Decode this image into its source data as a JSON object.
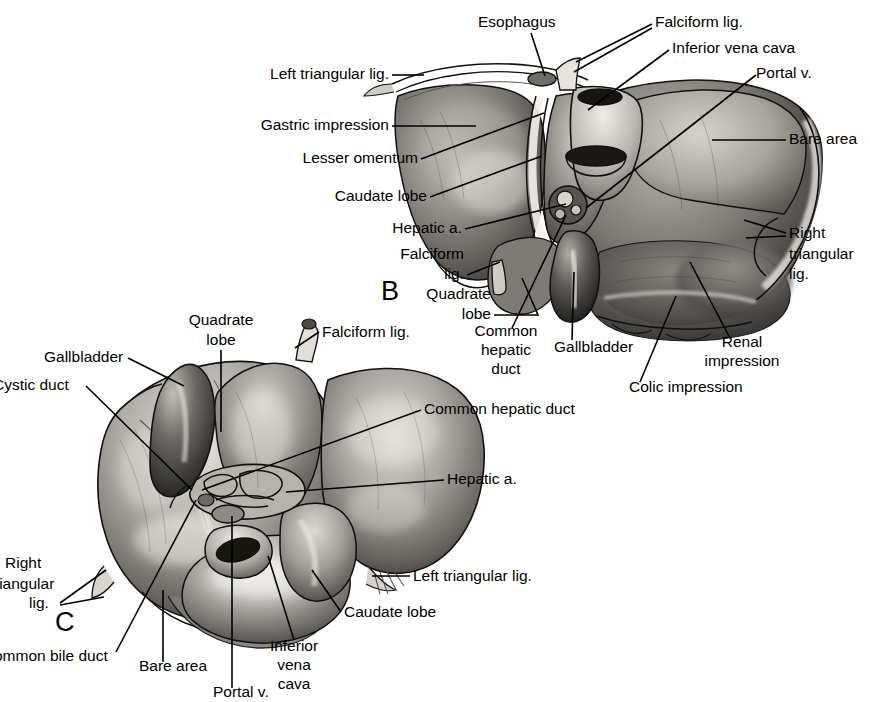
{
  "figure": {
    "panels": [
      {
        "id": "B",
        "letter": "B",
        "x": 381,
        "y": 300
      },
      {
        "id": "C",
        "letter": "C",
        "x": 55,
        "y": 631
      }
    ]
  },
  "panel_b": {
    "letter": "B",
    "labels": [
      {
        "name": "esophagus",
        "text": "Esophagus",
        "x": 478,
        "y": 27,
        "anchor": "start"
      },
      {
        "name": "falciform-lig-top",
        "text": "Falciform lig.",
        "x": 655,
        "y": 27,
        "anchor": "start"
      },
      {
        "name": "inferior-vena-cava",
        "text": "Inferior vena cava",
        "x": 672,
        "y": 53,
        "anchor": "start"
      },
      {
        "name": "portal-v",
        "text": "Portal v.",
        "x": 756,
        "y": 78,
        "anchor": "start"
      },
      {
        "name": "left-triangular-lig",
        "text": "Left triangular lig.",
        "x": 389,
        "y": 79,
        "anchor": "end"
      },
      {
        "name": "gastric-impression",
        "text": "Gastric impression",
        "x": 389,
        "y": 130,
        "anchor": "end"
      },
      {
        "name": "lesser-omentum",
        "text": "Lesser omentum",
        "x": 418,
        "y": 163,
        "anchor": "end"
      },
      {
        "name": "caudate-lobe",
        "text": "Caudate lobe",
        "x": 427,
        "y": 201,
        "anchor": "end"
      },
      {
        "name": "hepatic-a",
        "text": "Hepatic a.",
        "x": 462,
        "y": 233,
        "anchor": "end"
      },
      {
        "name": "falciform-lig-2a",
        "text": "Falciform",
        "x": 464,
        "y": 259,
        "anchor": "end"
      },
      {
        "name": "falciform-lig-2b",
        "text": "lig.",
        "x": 464,
        "y": 279,
        "anchor": "end"
      },
      {
        "name": "bare-area",
        "text": "Bare area",
        "x": 789,
        "y": 144,
        "anchor": "start"
      },
      {
        "name": "right-triangular-a",
        "text": "Right",
        "x": 789,
        "y": 238,
        "anchor": "start"
      },
      {
        "name": "right-triangular-b",
        "text": "triangular",
        "x": 789,
        "y": 259,
        "anchor": "start"
      },
      {
        "name": "right-triangular-c",
        "text": "lig.",
        "x": 789,
        "y": 279,
        "anchor": "start"
      },
      {
        "name": "quadrate-lobe-a",
        "text": "Quadrate",
        "x": 491,
        "y": 299,
        "anchor": "end"
      },
      {
        "name": "quadrate-lobe-b",
        "text": "lobe",
        "x": 491,
        "y": 319,
        "anchor": "end"
      },
      {
        "name": "common-hepatic-duct-a",
        "text": "Common",
        "x": 506,
        "y": 336,
        "anchor": "middle"
      },
      {
        "name": "common-hepatic-duct-b",
        "text": "hepatic",
        "x": 506,
        "y": 355,
        "anchor": "middle"
      },
      {
        "name": "common-hepatic-duct-c",
        "text": "duct",
        "x": 506,
        "y": 374,
        "anchor": "middle"
      },
      {
        "name": "gallbladder",
        "text": "Gallbladder",
        "x": 554,
        "y": 352,
        "anchor": "start"
      },
      {
        "name": "renal-impression-a",
        "text": "Renal",
        "x": 742,
        "y": 347,
        "anchor": "middle"
      },
      {
        "name": "renal-impression-b",
        "text": "impression",
        "x": 742,
        "y": 366,
        "anchor": "middle"
      },
      {
        "name": "colic-impression",
        "text": "Colic impression",
        "x": 629,
        "y": 392,
        "anchor": "start"
      }
    ]
  },
  "panel_c": {
    "letter": "C",
    "labels": [
      {
        "name": "quadrate-lobe-a",
        "text": "Quadrate",
        "x": 221,
        "y": 325,
        "anchor": "middle"
      },
      {
        "name": "quadrate-lobe-b",
        "text": "lobe",
        "x": 221,
        "y": 345,
        "anchor": "middle"
      },
      {
        "name": "falciform-lig",
        "text": "Falciform lig.",
        "x": 322,
        "y": 337,
        "anchor": "start"
      },
      {
        "name": "gallbladder",
        "text": "Gallbladder",
        "x": 44,
        "y": 362,
        "anchor": "start"
      },
      {
        "name": "cystic-duct",
        "text": "Cystic duct",
        "x": 0,
        "y": 390,
        "anchor": "start"
      },
      {
        "name": "common-hepatic-duct",
        "text": "Common hepatic duct",
        "x": 424,
        "y": 414,
        "anchor": "start"
      },
      {
        "name": "hepatic-a",
        "text": "Hepatic a.",
        "x": 447,
        "y": 484,
        "anchor": "start"
      },
      {
        "name": "left-triangular-lig",
        "text": "Left triangular lig.",
        "x": 413,
        "y": 581,
        "anchor": "start"
      },
      {
        "name": "caudate-lobe",
        "text": "Caudate lobe",
        "x": 344,
        "y": 617,
        "anchor": "start"
      },
      {
        "name": "right-triangular-a",
        "text": "Right",
        "x": 5,
        "y": 568,
        "anchor": "start"
      },
      {
        "name": "right-triangular-b",
        "text": "riangular",
        "x": 0,
        "y": 589,
        "anchor": "start"
      },
      {
        "name": "right-triangular-c",
        "text": "lig.",
        "x": 29,
        "y": 608,
        "anchor": "start"
      },
      {
        "name": "common-bile-duct",
        "text": "ommon bile duct",
        "x": 0,
        "y": 661,
        "anchor": "start"
      },
      {
        "name": "bare-area",
        "text": "Bare area",
        "x": 139,
        "y": 671,
        "anchor": "start"
      },
      {
        "name": "portal-v",
        "text": "Portal v.",
        "x": 213,
        "y": 697,
        "anchor": "start"
      },
      {
        "name": "inferior-vena-cava-a",
        "text": "Inferior",
        "x": 294,
        "y": 651,
        "anchor": "middle"
      },
      {
        "name": "inferior-vena-cava-b",
        "text": "vena",
        "x": 294,
        "y": 670,
        "anchor": "middle"
      },
      {
        "name": "inferior-vena-cava-c",
        "text": "cava",
        "x": 294,
        "y": 689,
        "anchor": "middle"
      }
    ]
  },
  "colors": {
    "ink": "#000000",
    "background": "#ffffff",
    "tissue_light": "#d8d5d0",
    "tissue_mid": "#9a9690",
    "tissue_dark": "#4a4744",
    "tissue_deep": "#2a2826"
  }
}
